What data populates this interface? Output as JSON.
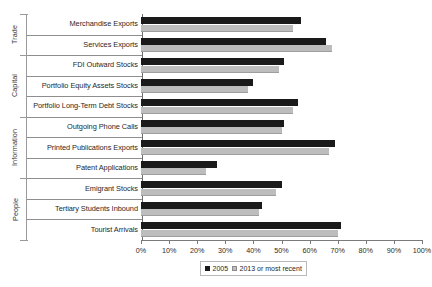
{
  "chart_data": {
    "type": "bar",
    "orientation": "horizontal",
    "title": "",
    "subtitle": "",
    "xlabel": "",
    "ylabel": "",
    "xlim": [
      0,
      100
    ],
    "grid": false,
    "legend_position": "bottom",
    "categories": [
      "Merchandise Exports",
      "Services Exports",
      "FDI Outward Stocks",
      "Portfolio Equity Assets Stocks",
      "Portfolio Long-Term Debt Stocks",
      "Outgoing Phone Calls",
      "Printed Publications Exports",
      "Patent Applications",
      "Emigrant Stocks",
      "Tertiary Students Inbound",
      "Tourist Arrivals"
    ],
    "groups": [
      {
        "label": "Trade",
        "start": 0,
        "count": 2
      },
      {
        "label": "Capital",
        "start": 2,
        "count": 3
      },
      {
        "label": "Information",
        "start": 5,
        "count": 3
      },
      {
        "label": "People",
        "start": 8,
        "count": 3
      }
    ],
    "series": [
      {
        "name": "2005",
        "color": "#1a1a1a",
        "values": [
          57,
          66,
          51,
          40,
          56,
          51,
          69,
          27,
          50,
          43,
          71
        ]
      },
      {
        "name": "2013 or most recent",
        "color": "#bdbdbd",
        "values": [
          54,
          68,
          49,
          38,
          54,
          50,
          67,
          23,
          48,
          42,
          70
        ]
      }
    ],
    "x_ticks": [
      0,
      10,
      20,
      30,
      40,
      50,
      60,
      70,
      80,
      90,
      100
    ],
    "x_tick_labels": [
      "0%",
      "10%",
      "20%",
      "30%",
      "40%",
      "50%",
      "60%",
      "70%",
      "80%",
      "90%",
      "100%"
    ]
  },
  "legend": {
    "items": [
      {
        "label": "2005"
      },
      {
        "label": "2013 or most recent"
      }
    ]
  }
}
